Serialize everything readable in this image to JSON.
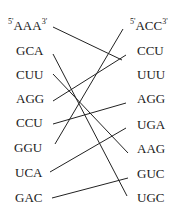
{
  "left_column": {
    "prime5": "5'",
    "prime3": "3'",
    "codons": [
      "AAA",
      "GCA",
      "CUU",
      "AGG",
      "CCU",
      "GGU",
      "UCA",
      "GAC"
    ]
  },
  "right_column": {
    "prime5": "5'",
    "prime3": "3'",
    "codons": [
      "ACC",
      "CCU",
      "UUU",
      "AGG",
      "UGA",
      "AAG",
      "GUC",
      "UGC"
    ]
  },
  "connections": [
    {
      "from": "AAA",
      "to": "UUU"
    },
    {
      "from": "GCA",
      "to": "UGC"
    },
    {
      "from": "CUU",
      "to": "AAG"
    },
    {
      "from": "AGG",
      "to": "CCU"
    },
    {
      "from": "CCU",
      "to": "AGG"
    },
    {
      "from": "GGU",
      "to": "ACC"
    },
    {
      "from": "UCA",
      "to": "UGA"
    },
    {
      "from": "GAC",
      "to": "GUC"
    }
  ],
  "colors": {
    "line": "#222222",
    "text": "#1a1a1a",
    "background": "#ffffff"
  }
}
